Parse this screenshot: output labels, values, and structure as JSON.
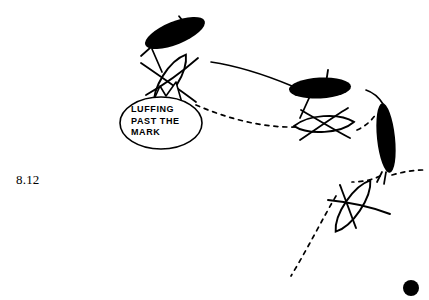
{
  "figure": {
    "number": "8.12",
    "background_color": "#ffffff",
    "ink_color": "#000000",
    "width": 429,
    "height": 300
  },
  "callout": {
    "lines": [
      "LUFFING",
      "PAST THE",
      "MARK"
    ],
    "line1": "LUFFING",
    "line2": "PAST THE",
    "line3": "MARK",
    "shape": "speech-bubble-ellipse",
    "tail": "jagged-up"
  },
  "diagram": {
    "type": "sailing-maneuver-illustration",
    "mark": {
      "name": "racing-mark-buoy",
      "shape": "filled-circle",
      "cx": 411,
      "cy": 288,
      "r": 8
    },
    "boats": [
      {
        "id": "boat-black-upper",
        "fill": "solid-black",
        "role": "windward-boat-position-1",
        "cx": 175,
        "cy": 33,
        "rx": 32,
        "ry": 11,
        "rotation": -22
      },
      {
        "id": "boat-white-upper",
        "fill": "outline",
        "role": "leeward-boat-position-1",
        "cx": 170,
        "cy": 80,
        "rx": 30,
        "ry": 11,
        "rotation": -58
      },
      {
        "id": "boat-black-middle",
        "fill": "solid-black",
        "role": "windward-boat-position-2",
        "cx": 320,
        "cy": 88,
        "rx": 31,
        "ry": 10,
        "rotation": -3
      },
      {
        "id": "boat-white-middle",
        "fill": "outline",
        "role": "leeward-boat-position-2",
        "cx": 324,
        "cy": 124,
        "rx": 30,
        "ry": 10,
        "rotation": -4
      },
      {
        "id": "boat-black-right",
        "fill": "solid-black",
        "role": "windward-boat-position-3",
        "cx": 386,
        "cy": 138,
        "rx": 9,
        "ry": 34,
        "rotation": -6
      },
      {
        "id": "boat-white-lower",
        "fill": "outline",
        "role": "leeward-boat-position-3",
        "cx": 353,
        "cy": 206,
        "rx": 30,
        "ry": 11,
        "rotation": -56
      }
    ],
    "tracks": [
      {
        "id": "track-windward-boat",
        "style": "solid",
        "description": "curved wake of the black boats"
      },
      {
        "id": "track-leeward-boat",
        "style": "dashed",
        "description": "curved wake of the white outline boats toward the mark"
      }
    ]
  }
}
